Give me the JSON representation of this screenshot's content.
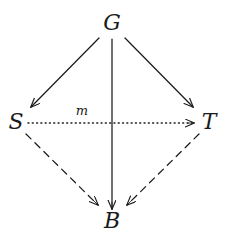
{
  "diagram": {
    "background_color": "#ffffff",
    "ink_color": "#1b1b1b",
    "nodes": [
      {
        "id": "G",
        "label": "G",
        "x": 112,
        "y": 23
      },
      {
        "id": "S",
        "label": "S",
        "x": 16,
        "y": 122
      },
      {
        "id": "T",
        "label": "T",
        "x": 209,
        "y": 122
      },
      {
        "id": "B",
        "label": "B",
        "x": 112,
        "y": 221
      }
    ],
    "edges": [
      {
        "id": "g-to-s",
        "from": "G",
        "to": "S",
        "style": "solid",
        "arrowhead": "open-v",
        "label": "",
        "x1": 99,
        "y1": 38,
        "x2": 31,
        "y2": 107
      },
      {
        "id": "g-to-b",
        "from": "G",
        "to": "B",
        "style": "solid",
        "arrowhead": "open-v",
        "label": "",
        "x1": 112,
        "y1": 39,
        "x2": 112,
        "y2": 209
      },
      {
        "id": "g-to-t",
        "from": "G",
        "to": "T",
        "style": "solid",
        "arrowhead": "open-v",
        "label": "",
        "x1": 125,
        "y1": 38,
        "x2": 193,
        "y2": 107
      },
      {
        "id": "s-to-t",
        "from": "S",
        "to": "T",
        "style": "dotted",
        "arrowhead": "open-v",
        "label": "m",
        "x1": 28,
        "y1": 123,
        "x2": 194,
        "y2": 123
      },
      {
        "id": "s-to-b",
        "from": "S",
        "to": "B",
        "style": "dashed",
        "arrowhead": "open-v",
        "label": "",
        "x1": 26,
        "y1": 134,
        "x2": 98,
        "y2": 205
      },
      {
        "id": "t-to-b",
        "from": "T",
        "to": "B",
        "style": "dashed",
        "arrowhead": "open-v",
        "label": "",
        "x1": 199,
        "y1": 134,
        "x2": 127,
        "y2": 205
      }
    ],
    "edge_labels": [
      {
        "id": "m",
        "text": "m",
        "x": 82,
        "y": 110
      }
    ]
  }
}
